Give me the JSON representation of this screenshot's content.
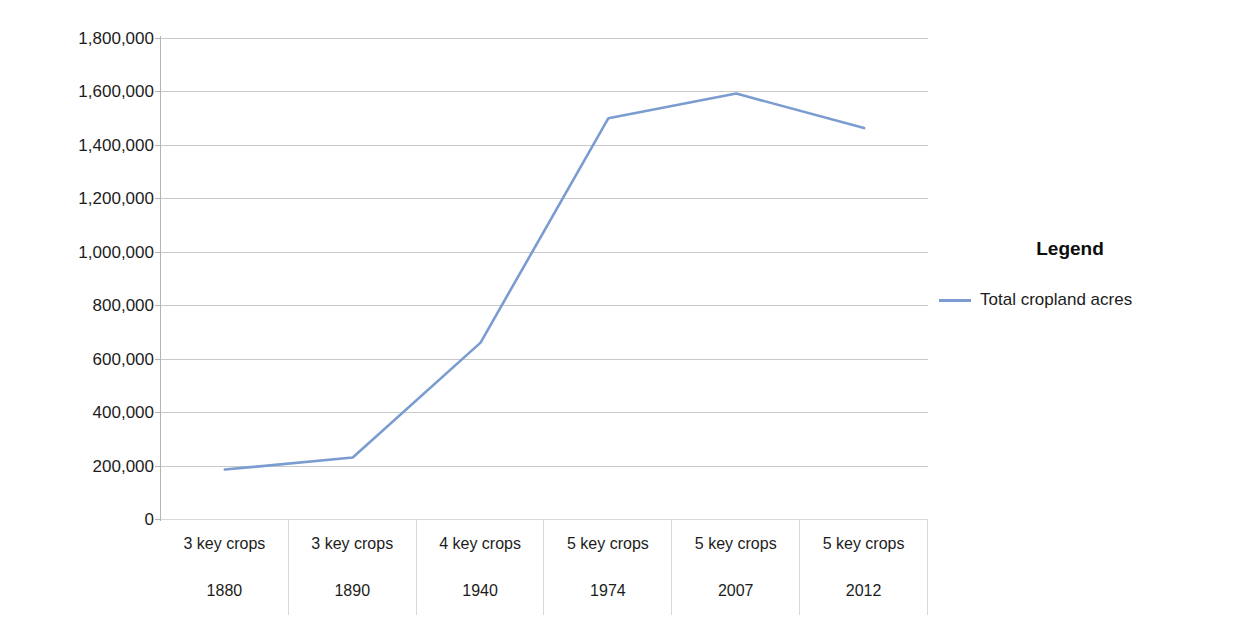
{
  "chart_data": {
    "type": "line",
    "title": "",
    "xlabel": "",
    "ylabel": "",
    "ylim": [
      0,
      1800000
    ],
    "grid": true,
    "legend_position": "right",
    "legend_title": "Legend",
    "series": [
      {
        "name": "Total cropland acres",
        "color": "#7b9cd0",
        "values": [
          185000,
          230000,
          660000,
          1500000,
          1592000,
          1463000
        ]
      }
    ],
    "categories": [
      "1880",
      "1890",
      "1940",
      "1974",
      "2007",
      "2012"
    ],
    "category_groups": [
      "3 key crops",
      "3 key crops",
      "4 key crops",
      "5 key crops",
      "5 key crops",
      "5 key crops"
    ],
    "ytick_labels": [
      "1,800,000",
      "1,600,000",
      "1,400,000",
      "1,200,000",
      "1,000,000",
      "800,000",
      "600,000",
      "400,000",
      "200,000",
      "0"
    ],
    "ytick_values": [
      1800000,
      1600000,
      1400000,
      1200000,
      1000000,
      800000,
      600000,
      400000,
      200000,
      0
    ]
  },
  "legend": {
    "title": "Legend",
    "entries": [
      {
        "label": "Total cropland acres",
        "color": "#7b9cd0"
      }
    ]
  }
}
